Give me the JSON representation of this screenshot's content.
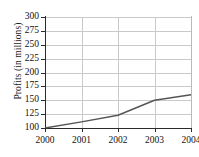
{
  "chart_data": {
    "type": "line",
    "title": "",
    "xlabel": "",
    "ylabel": "Profits (in millions)",
    "categories": [
      "2000",
      "2001",
      "2002",
      "2003",
      "2004"
    ],
    "x": [
      2000,
      2001,
      2002,
      2003,
      2004
    ],
    "values": [
      100,
      111,
      123,
      150,
      160
    ],
    "series": [
      {
        "name": "Profits",
        "values": [
          100,
          111,
          123,
          150,
          160
        ]
      }
    ],
    "ylim": [
      100,
      300
    ],
    "xlim": [
      2000,
      2004
    ],
    "yticks": [
      100,
      125,
      150,
      175,
      200,
      225,
      250,
      275,
      300
    ],
    "ytick_labels": [
      "100",
      "125",
      "150",
      "175",
      "200",
      "225",
      "250",
      "275",
      "300"
    ],
    "xticks": [
      2000,
      2001,
      2002,
      2003,
      2004
    ],
    "xtick_labels": [
      "2000",
      "2001",
      "2002",
      "2003",
      "2004"
    ],
    "grid": true,
    "grid_axis": "both",
    "legend": false,
    "legend_position": "none",
    "line_color": "#555555",
    "grid_color": "#c9c9c9",
    "axis_color": "#2b2b2b",
    "background_color": "#ffffff"
  }
}
